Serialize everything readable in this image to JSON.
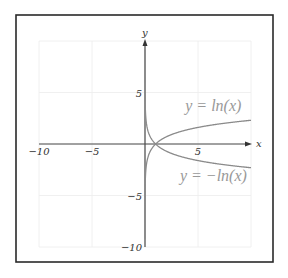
{
  "chart_data": {
    "type": "line",
    "title": "",
    "xlabel": "x",
    "ylabel": "y",
    "xlim": [
      -10,
      10
    ],
    "ylim": [
      -10,
      10
    ],
    "grid": true,
    "x_ticks": [
      {
        "value": -10,
        "label": "−10"
      },
      {
        "value": -5,
        "label": "−5"
      },
      {
        "value": 5,
        "label": "5"
      }
    ],
    "y_ticks": [
      {
        "value": 5,
        "label": "5"
      },
      {
        "value": -5,
        "label": "−5"
      },
      {
        "value": -10,
        "label": "−10"
      }
    ],
    "grid_values": {
      "x": [
        -10,
        -5,
        0,
        5,
        10
      ],
      "y": [
        -10,
        -5,
        0,
        5,
        10
      ]
    },
    "series": [
      {
        "name": "y = ln(x)",
        "function": "ln",
        "domain": [
          0.0001,
          10
        ],
        "label": "y = ln(x)",
        "label_at": [
          3.8,
          3.2
        ]
      },
      {
        "name": "y = -ln(x)",
        "function": "neg_ln",
        "domain": [
          0.0001,
          10
        ],
        "label": "y = −ln(x)",
        "label_at": [
          3.3,
          -3.6
        ]
      }
    ]
  }
}
